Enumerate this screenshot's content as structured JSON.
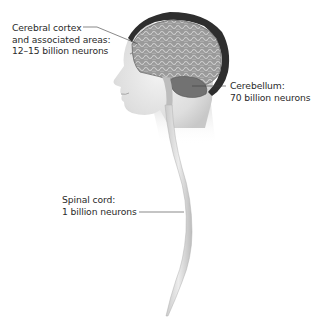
{
  "figure": {
    "labels": {
      "cerebral_cortex": {
        "line1": "Cerebral cortex",
        "line2": "and associated areas:",
        "line3": "12–15 billion neurons"
      },
      "cerebellum": {
        "line1": "Cerebellum:",
        "line2": "70 billion neurons"
      },
      "spinal_cord": {
        "line1": "Spinal cord:",
        "line2": "1 billion neurons"
      }
    },
    "colors": {
      "skin": "#e4e4e4",
      "hair": "#2e2e2e",
      "brain": "#8a8a8a",
      "cerebellum": "#6a6a6a",
      "spinal_cord": "#d6d6d6",
      "leader_line": "#3a3a3a",
      "text": "#2a2a2a"
    }
  }
}
